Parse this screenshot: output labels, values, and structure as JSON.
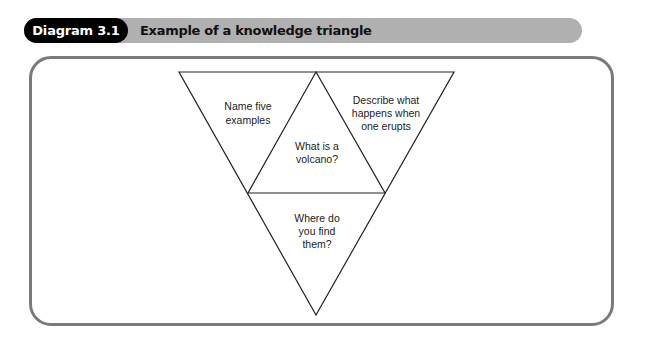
{
  "header": {
    "label": "Diagram 3.1",
    "title": "Example of a knowledge triangle",
    "label_bg": "#000000",
    "bar_bg": "#b0b0b0"
  },
  "diagram": {
    "type": "knowledge-triangle",
    "center": {
      "lines": [
        "What is a",
        "volcano?"
      ]
    },
    "top_left": {
      "lines": [
        "Name five",
        "examples"
      ]
    },
    "top_right": {
      "lines": [
        "Describe what",
        "happens when",
        "one erupts"
      ]
    },
    "bottom": {
      "lines": [
        "Where do",
        "you find",
        "them?"
      ]
    }
  }
}
